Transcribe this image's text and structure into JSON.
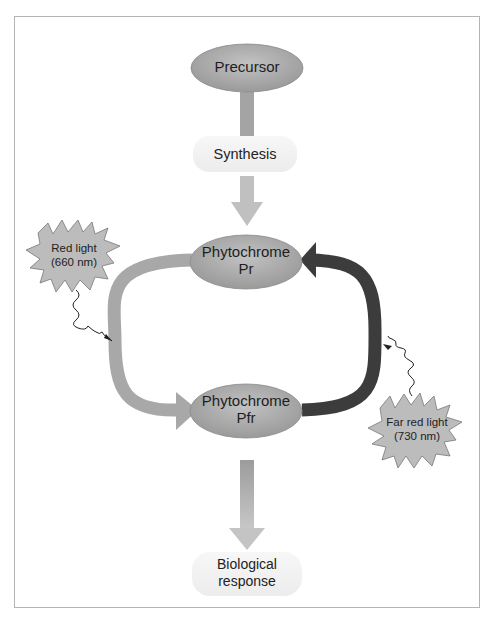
{
  "diagram": {
    "nodes": {
      "precursor": {
        "label": "Precursor"
      },
      "pr": {
        "line1": "Phytochrome",
        "line2": "Pr"
      },
      "pfr": {
        "line1": "Phytochrome",
        "line2": "Pfr"
      }
    },
    "process_boxes": {
      "synthesis": {
        "label": "Synthesis"
      },
      "response": {
        "line1": "Biological",
        "line2": "response"
      }
    },
    "light_sources": {
      "red": {
        "line1": "Red light",
        "line2": "(660 nm)"
      },
      "far_red": {
        "line1": "Far red light",
        "line2": "(730 nm)"
      }
    },
    "edges": [
      {
        "from": "precursor",
        "to": "pr",
        "via": "synthesis"
      },
      {
        "from": "pr",
        "to": "pfr",
        "trigger": "red"
      },
      {
        "from": "pfr",
        "to": "pr",
        "trigger": "far_red"
      },
      {
        "from": "pfr",
        "to": "response"
      }
    ],
    "colors": {
      "node_fill": "#a9a9a9",
      "light_arrow": "#a8a8a8",
      "far_red_arrow": "#3c3c3c",
      "star_fill": "#bcbcbc",
      "frame": "#b4b4b4"
    }
  }
}
